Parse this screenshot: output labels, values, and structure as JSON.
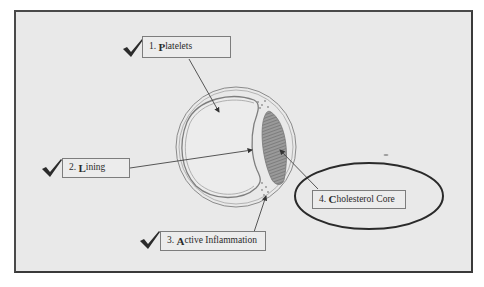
{
  "diagram": {
    "type": "artery cross-section (atherosclerotic plaque)",
    "labels": [
      {
        "id": "platelets",
        "number": "1.",
        "first_letter": "P",
        "rest": "latelets",
        "text": "1. Platelets",
        "checked": true
      },
      {
        "id": "lining",
        "number": "2.",
        "first_letter": "L",
        "rest": "ining",
        "text": "2. Lining",
        "checked": true
      },
      {
        "id": "active-inflammation",
        "number": "3.",
        "first_letter": "A",
        "rest": "ctive Inflammation",
        "text": "3. Active Inflammation",
        "checked": true
      },
      {
        "id": "cholesterol-core",
        "number": "4.",
        "first_letter": "C",
        "rest": "holesterol Core",
        "text": "4. Cholesterol Core",
        "checked": false,
        "circled": true
      }
    ],
    "colors": {
      "background": "#e9e9e9",
      "frame_border": "#4a4a4a",
      "line": "#555555",
      "checkmark": "#2b2b2b",
      "ellipse": "#2a2a2a"
    }
  }
}
